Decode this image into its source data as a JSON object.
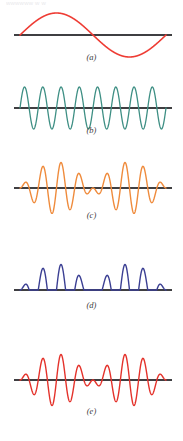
{
  "figure": {
    "cut_header_text": "wwwwww           w       w",
    "background": "#ffffff",
    "width": 183,
    "height": 441,
    "axis_color": "#3f3f42",
    "axis_width": 2.0,
    "axis_x_start": 14,
    "axis_x_end": 172
  },
  "chart_data": {
    "type": "line",
    "title": "",
    "subtitle": "",
    "xlabel": "",
    "ylabel": "",
    "grid": false,
    "legend_position": "none",
    "shared_x_range": [
      0,
      1
    ],
    "panel_count": 5,
    "panels": [
      {
        "id": "a",
        "label": "(a)",
        "color": "#ee3b33",
        "line_width": 1.6,
        "description": "low-frequency envelope sine, one full cycle",
        "waveform": "sine",
        "cycles": 1.0,
        "amplitude": 22,
        "phase_deg": 0,
        "rectified": false,
        "modulated": false,
        "baseline_y": 35,
        "ylim": [
          -26,
          26
        ],
        "x_start": 20,
        "x_end": 166
      },
      {
        "id": "b",
        "label": "(b)",
        "color": "#3e8f84",
        "line_width": 1.3,
        "description": "high-frequency carrier sine, constant amplitude",
        "waveform": "sine",
        "cycles": 8.0,
        "amplitude": 21,
        "phase_deg": 0,
        "rectified": false,
        "modulated": false,
        "baseline_y": 108,
        "ylim": [
          -25,
          25
        ],
        "x_start": 20,
        "x_end": 166
      },
      {
        "id": "c",
        "label": "(c)",
        "color": "#ef8b3c",
        "line_width": 1.4,
        "description": "amplitude-modulated carrier: product of envelope and carrier",
        "waveform": "am",
        "cycles": 8.0,
        "envelope_cycles": 1.0,
        "amplitude": 26,
        "phase_deg": 0,
        "rectified": false,
        "modulated": true,
        "baseline_y": 188,
        "ylim": [
          -30,
          30
        ],
        "x_start": 20,
        "x_end": 166
      },
      {
        "id": "d",
        "label": "(d)",
        "color": "#3b3f93",
        "line_width": 1.4,
        "description": "half-wave rectified amplitude-modulated signal, positive humps only",
        "waveform": "am-rectified",
        "cycles": 8.0,
        "envelope_cycles": 1.0,
        "amplitude": 26,
        "phase_deg": 0,
        "rectified": true,
        "modulated": true,
        "baseline_y": 290,
        "ylim": [
          0,
          30
        ],
        "x_start": 20,
        "x_end": 166
      },
      {
        "id": "e",
        "label": "(e)",
        "color": "#e4322b",
        "line_width": 1.4,
        "description": "amplitude-modulated carrier shown in red",
        "waveform": "am",
        "cycles": 8.0,
        "envelope_cycles": 1.0,
        "amplitude": 26,
        "phase_deg": 0,
        "rectified": false,
        "modulated": true,
        "baseline_y": 380,
        "ylim": [
          -30,
          30
        ],
        "x_start": 20,
        "x_end": 166
      }
    ],
    "labels": [
      "(a)",
      "(b)",
      "(c)",
      "(d)",
      "(e)"
    ],
    "label_y_positions": [
      58,
      131,
      214,
      306,
      411
    ]
  }
}
